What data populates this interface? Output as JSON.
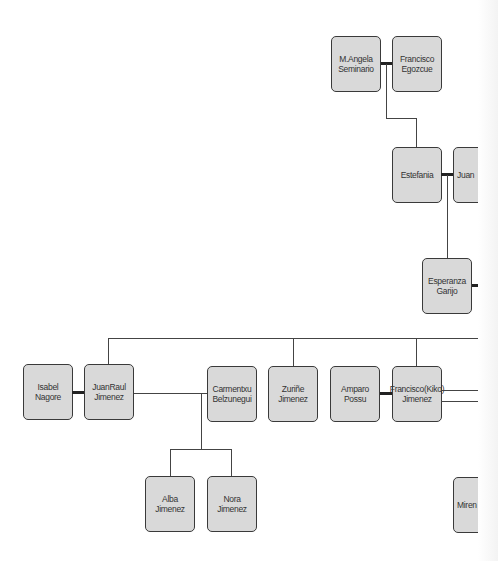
{
  "diagram": {
    "type": "family-tree",
    "nodes": {
      "m_angela": {
        "label": "M.Angela Seminario"
      },
      "francisco_egozcue": {
        "label": "Francisco Egozcue"
      },
      "estefania": {
        "label": "Estefania"
      },
      "juan": {
        "label": "Juan"
      },
      "esperanza": {
        "label": "Esperanza Garijo"
      },
      "isabel": {
        "label": "Isabel Nagore"
      },
      "juanraul": {
        "label": "JuanRaul Jimenez"
      },
      "carmentxu": {
        "label": "Carmentxu Belzunegui"
      },
      "zurine": {
        "label": "Zuriñe Jimenez"
      },
      "amparo": {
        "label": "Amparo Possu"
      },
      "kiko": {
        "label": "Francisco(Kiko) Jimenez"
      },
      "alba": {
        "label": "Alba Jimenez"
      },
      "nora": {
        "label": "Nora Jimenez"
      },
      "miren": {
        "label": "Miren ..."
      }
    },
    "relationships": [
      {
        "type": "couple",
        "a": "M.Angela Seminario",
        "b": "Francisco Egozcue"
      },
      {
        "type": "child",
        "parents": "M.Angela Seminario + Francisco Egozcue",
        "child": "Estefania"
      },
      {
        "type": "couple",
        "a": "Estefania",
        "b": "Juan"
      },
      {
        "type": "child",
        "parents": "Estefania + Juan",
        "child": "Esperanza Garijo"
      },
      {
        "type": "couple",
        "a": "Isabel Nagore",
        "b": "JuanRaul Jimenez"
      },
      {
        "type": "couple",
        "a": "Amparo Possu",
        "b": "Francisco(Kiko) Jimenez"
      },
      {
        "type": "relation",
        "a": "JuanRaul Jimenez",
        "b": "Carmentxu Belzunegui"
      },
      {
        "type": "child",
        "parents": "JuanRaul Jimenez + Carmentxu Belzunegui",
        "child": "Alba Jimenez"
      },
      {
        "type": "child",
        "parents": "JuanRaul Jimenez + Carmentxu Belzunegui",
        "child": "Nora Jimenez"
      },
      {
        "type": "siblings",
        "members": [
          "JuanRaul Jimenez",
          "Zuriñe Jimenez",
          "Francisco(Kiko) Jimenez"
        ]
      }
    ],
    "colors": {
      "node_fill": "#d9d9d9",
      "node_border": "#3a3a3a",
      "line": "#444444"
    }
  }
}
